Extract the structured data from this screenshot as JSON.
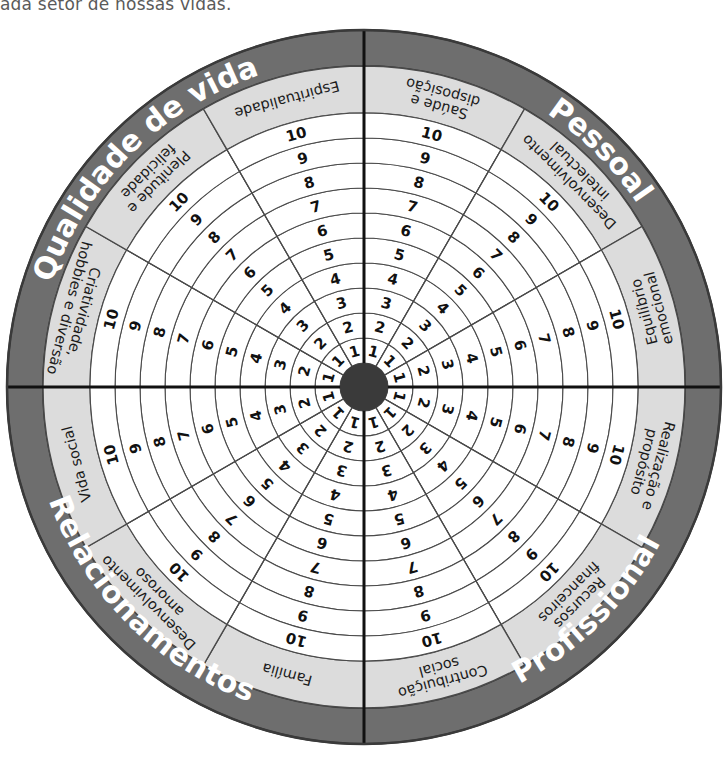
{
  "page": {
    "caption_fragment": "ada setor de nossas vidas.",
    "diagram_name": "Roda da Vida"
  },
  "colors": {
    "quadrant_band": "#6e6e6e",
    "quadrant_band_text": "#ffffff",
    "area_band": "#dcdcdc",
    "area_band_text": "#1a1a1a",
    "scale_ring_fill": "#ffffff",
    "scale_ring_stroke": "#4a4a4a",
    "hub": "#3a3a3a",
    "divider": "#111111",
    "outer_edge": "#3a3a3a"
  },
  "geometry": {
    "center_x": 364,
    "center_y": 387,
    "outer_radius": 357,
    "quadrant_band_inner_radius": 321,
    "area_band_inner_radius": 274,
    "hub_radius": 24,
    "ring_count": 10
  },
  "scale": {
    "min": 1,
    "max": 10,
    "labels": [
      "1",
      "2",
      "3",
      "4",
      "5",
      "6",
      "7",
      "8",
      "9",
      "10"
    ]
  },
  "quadrants": [
    {
      "id": "qualidade-de-vida",
      "label": "Qualidade de vida",
      "start_angle": 180,
      "end_angle": 270,
      "areas": [
        {
          "id": "criatividade-hobbies-e-diversao",
          "label": "Criatividade, hobbies e diversão",
          "lines": [
            "Criatividade,",
            "hobbies e diversão"
          ]
        },
        {
          "id": "plenitude-e-felicidade",
          "label": "Plenitude e felicidade",
          "lines": [
            "Plenitude e",
            "felicidade"
          ]
        },
        {
          "id": "espiritualidade",
          "label": "Espiritualidade",
          "lines": [
            "Espiritualidade"
          ]
        }
      ]
    },
    {
      "id": "pessoal",
      "label": "Pessoal",
      "start_angle": 270,
      "end_angle": 360,
      "areas": [
        {
          "id": "saude-e-disposicao",
          "label": "Saúde e disposição",
          "lines": [
            "Saúde e",
            "disposição"
          ]
        },
        {
          "id": "desenvolvimento-intelectual",
          "label": "Desenvolvimento intelectual",
          "lines": [
            "Desenvolvimento",
            "intelectual"
          ]
        },
        {
          "id": "equilibrio-emocional",
          "label": "Equilíbrio emocional",
          "lines": [
            "Equilíbrio",
            "emocional"
          ]
        }
      ]
    },
    {
      "id": "profissional",
      "label": "Profissional",
      "start_angle": 0,
      "end_angle": 90,
      "areas": [
        {
          "id": "realizacao-e-proposito",
          "label": "Realização e propósito",
          "lines": [
            "Realização e",
            "propósito"
          ]
        },
        {
          "id": "recursos-financeiros",
          "label": "Recursos financeiros",
          "lines": [
            "Recursos",
            "financeiros"
          ]
        },
        {
          "id": "contribuicao-social",
          "label": "Contribuição social",
          "lines": [
            "Contribuição",
            "social"
          ]
        }
      ]
    },
    {
      "id": "relacionamentos",
      "label": "Relacionamentos",
      "start_angle": 90,
      "end_angle": 180,
      "areas": [
        {
          "id": "familia",
          "label": "Família",
          "lines": [
            "Família"
          ]
        },
        {
          "id": "desenvolvimento-amoroso",
          "label": "Desenvolvimento amoroso",
          "lines": [
            "Desenvolvimento",
            "amoroso"
          ]
        },
        {
          "id": "vida-social",
          "label": "Vida social",
          "lines": [
            "Vida social"
          ]
        }
      ]
    }
  ]
}
